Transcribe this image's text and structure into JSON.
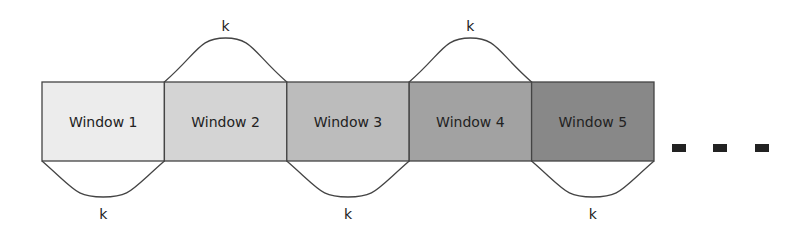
{
  "diagram": {
    "title": "",
    "windows": [
      {
        "label": "Window 1",
        "color": "#ececec"
      },
      {
        "label": "Window 2",
        "color": "#d4d4d4"
      },
      {
        "label": "Window 3",
        "color": "#bcbcbc"
      },
      {
        "label": "Window 4",
        "color": "#a2a2a2"
      },
      {
        "label": "Window 5",
        "color": "#888888"
      }
    ],
    "arcs": [
      {
        "window": 0,
        "side": "bottom",
        "label": "k"
      },
      {
        "window": 1,
        "side": "top",
        "label": "k"
      },
      {
        "window": 2,
        "side": "bottom",
        "label": "k"
      },
      {
        "window": 3,
        "side": "top",
        "label": "k"
      },
      {
        "window": 4,
        "side": "bottom",
        "label": "k"
      }
    ],
    "continuation": {
      "count": 3,
      "color": "#222222",
      "meaning": "more windows"
    },
    "stroke_color": "#444444"
  }
}
